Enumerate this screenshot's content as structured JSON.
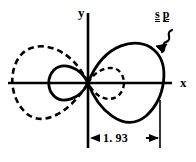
{
  "figure": {
    "type": "sp-hybrid-orbital-polar-plot",
    "axes": {
      "x_label": "x",
      "y_label": "y",
      "origin": [
        88,
        83
      ]
    },
    "annotation": {
      "orbital_label_parts": [
        "s",
        "p"
      ],
      "pointer_icon": "squiggly-arrow-icon"
    },
    "dimension": {
      "value": "1. 93",
      "from": "origin",
      "to": "right-lobe-extent"
    },
    "lobes": [
      {
        "name": "right-large-lobe",
        "style": "solid",
        "side": "right",
        "extent": 1.93
      },
      {
        "name": "left-large-lobe",
        "style": "dashed",
        "side": "left",
        "extent": 1.93
      },
      {
        "name": "left-small-lobe",
        "style": "solid",
        "side": "left",
        "extent": 0.49
      },
      {
        "name": "right-small-lobe",
        "style": "dashed",
        "side": "right",
        "extent": 0.49
      }
    ],
    "colors": {
      "stroke": "#000000",
      "background": "#ffffff"
    }
  }
}
